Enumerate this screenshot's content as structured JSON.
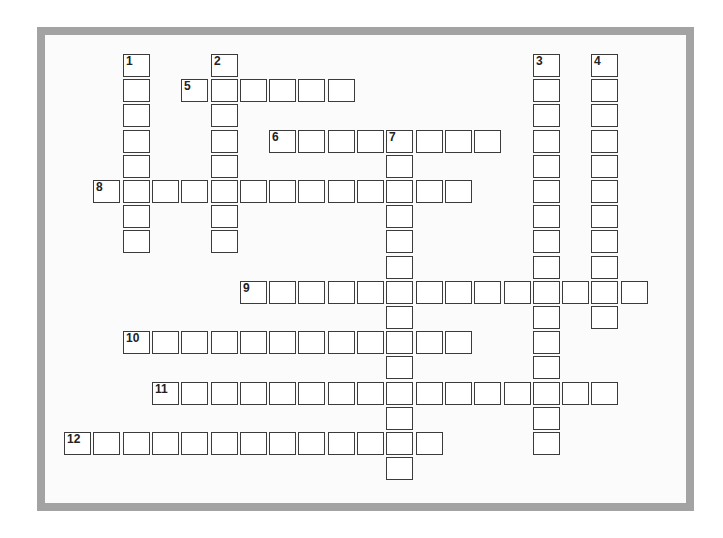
{
  "puzzle": {
    "type": "crossword",
    "colors": {
      "frame": "#a3a3a3",
      "cell_border": "#3b3b3b",
      "cell_fill": "#ffffff",
      "background": "#fbfbfb"
    },
    "grid": {
      "origin_x": 64,
      "origin_y": 54,
      "pitch_x": 29.3,
      "pitch_y": 25.2
    },
    "entries": [
      {
        "number": "1",
        "direction": "down",
        "row": 0,
        "col": 2,
        "length": 8
      },
      {
        "number": "2",
        "direction": "down",
        "row": 0,
        "col": 5,
        "length": 8
      },
      {
        "number": "3",
        "direction": "down",
        "row": 0,
        "col": 16,
        "length": 16
      },
      {
        "number": "4",
        "direction": "down",
        "row": 0,
        "col": 18,
        "length": 11
      },
      {
        "number": "5",
        "direction": "across",
        "row": 1,
        "col": 4,
        "length": 6
      },
      {
        "number": "6",
        "direction": "across",
        "row": 3,
        "col": 7,
        "length": 8
      },
      {
        "number": "7",
        "direction": "down",
        "row": 3,
        "col": 11,
        "length": 14
      },
      {
        "number": "8",
        "direction": "across",
        "row": 5,
        "col": 1,
        "length": 13
      },
      {
        "number": "9",
        "direction": "across",
        "row": 9,
        "col": 6,
        "length": 14
      },
      {
        "number": "10",
        "direction": "across",
        "row": 11,
        "col": 2,
        "length": 12
      },
      {
        "number": "11",
        "direction": "across",
        "row": 13,
        "col": 3,
        "length": 16
      },
      {
        "number": "12",
        "direction": "across",
        "row": 15,
        "col": 0,
        "length": 13
      }
    ]
  }
}
